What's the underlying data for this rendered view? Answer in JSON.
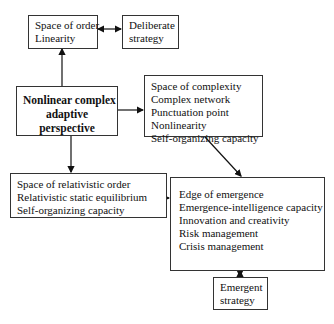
{
  "diagram": {
    "nodes": {
      "order": {
        "lines": [
          "Space of order",
          "Linearity"
        ]
      },
      "deliberate": {
        "lines": [
          "Deliberate",
          "strategy"
        ]
      },
      "nonlinear": {
        "lines": [
          "Nonlinear complex",
          "adaptive",
          "perspective"
        ]
      },
      "complexity": {
        "lines": [
          "Space of complexity",
          "Complex network",
          "Punctuation point",
          "Nonlinearity",
          "Self-organizing capacity"
        ]
      },
      "relativistic": {
        "lines": [
          "Space of relativistic order",
          "Relativistic static equilibrium",
          "Self-organizing capacity"
        ]
      },
      "edge": {
        "lines": [
          "Edge of emergence",
          "Emergence-intelligence capacity",
          "Innovation and creativity",
          "Risk management",
          "Crisis management"
        ]
      },
      "emergent": {
        "lines": [
          "Emergent",
          "strategy"
        ]
      }
    },
    "edges": [
      {
        "from": "order",
        "to": "deliberate",
        "type": "bidirectional"
      },
      {
        "from": "nonlinear",
        "to": "order",
        "type": "directed"
      },
      {
        "from": "nonlinear",
        "to": "complexity",
        "type": "directed"
      },
      {
        "from": "nonlinear",
        "to": "relativistic",
        "type": "directed"
      },
      {
        "from": "complexity",
        "to": "edge",
        "type": "directed"
      },
      {
        "from": "relativistic",
        "to": "edge",
        "type": "directed"
      },
      {
        "from": "edge",
        "to": "emergent",
        "type": "bidirectional"
      }
    ]
  }
}
